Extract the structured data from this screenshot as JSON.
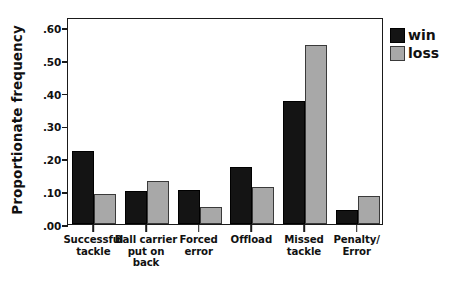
{
  "chart_data": {
    "type": "bar",
    "title": "",
    "xlabel": "",
    "ylabel": "Proportionate frequency",
    "ylim": [
      0.0,
      0.63
    ],
    "ytick_labels": [
      ".00",
      ".10",
      ".20",
      ".30",
      ".40",
      ".50",
      ".60"
    ],
    "ytick_values": [
      0.0,
      0.1,
      0.2,
      0.3,
      0.4,
      0.5,
      0.6
    ],
    "grid": false,
    "legend_position": "right",
    "categories": [
      "Successful\ntackle",
      "Ball carrier\nput on\nback",
      "Forced\nerror",
      "Offload",
      "Missed\ntackle",
      "Penalty/\nError"
    ],
    "series": [
      {
        "name": "win",
        "color": "#141414",
        "values": [
          0.222,
          0.102,
          0.103,
          0.174,
          0.375,
          0.043
        ]
      },
      {
        "name": "loss",
        "color": "#a8a8a8",
        "values": [
          0.092,
          0.132,
          0.053,
          0.113,
          0.545,
          0.085
        ]
      }
    ]
  },
  "legend": {
    "items": [
      {
        "label": "win",
        "swatch": "win"
      },
      {
        "label": "loss",
        "swatch": "loss"
      }
    ]
  }
}
